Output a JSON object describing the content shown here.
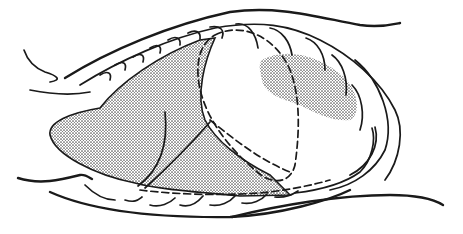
{
  "figure": {
    "colors": {
      "ink": "#1a1a1a",
      "stipple": "#555555",
      "background": "#ffffff"
    },
    "regions": [
      {
        "name": "left-stippled-mass",
        "shading": "stippled"
      },
      {
        "name": "right-stippled-patch",
        "shading": "stippled"
      },
      {
        "name": "central-dashed-oval",
        "shading": "none"
      }
    ]
  }
}
